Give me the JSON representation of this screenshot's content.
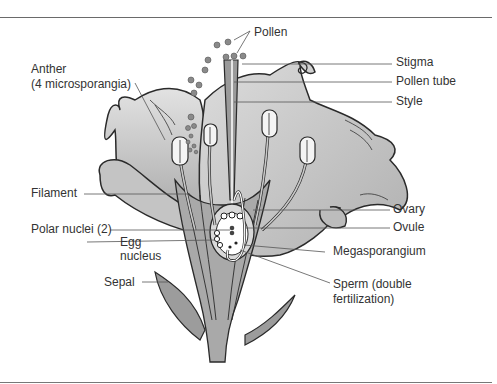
{
  "diagram": {
    "labels": {
      "pollen": "Pollen",
      "anther_line1": "Anther",
      "anther_line2": "(4 microsporangia)",
      "stigma": "Stigma",
      "pollen_tube": "Pollen tube",
      "style": "Style",
      "filament": "Filament",
      "ovary": "Ovary",
      "polar_nuclei": "Polar nuclei (2)",
      "ovule": "Ovule",
      "egg_line1": "Egg",
      "egg_line2": "nucleus",
      "megasporangium": "Megasporangium",
      "sepal": "Sepal",
      "sperm_line1": "Sperm (double",
      "sperm_line2": "fertilization)"
    },
    "colors": {
      "petal": "#cfcfcf",
      "petal_dark": "#b4b4b4",
      "stem": "#a9a9a9",
      "sepal": "#9c9c9c",
      "outline": "#2a2a2a",
      "anther": "#f4f4f4",
      "pollen": "#8a8a8a",
      "leader_line": "#555555"
    }
  }
}
